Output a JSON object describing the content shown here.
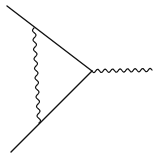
{
  "diagram": {
    "type": "feynman-vertex-correction",
    "canvas": {
      "width": 160,
      "height": 157,
      "background": "#ffffff",
      "stroke": "#111111"
    },
    "vertices": {
      "top": [
        34,
        28
      ],
      "bottom": [
        39,
        123
      ],
      "main": [
        92,
        71
      ]
    },
    "lines": [
      {
        "name": "incoming-fermion-top",
        "kind": "fermion",
        "from": [
          7,
          6
        ],
        "to": [
          92,
          71
        ]
      },
      {
        "name": "incoming-fermion-bottom",
        "kind": "fermion",
        "from": [
          11,
          152
        ],
        "to": [
          92,
          71
        ]
      },
      {
        "name": "external-photon",
        "kind": "boson",
        "from": [
          92,
          71
        ],
        "to": [
          152,
          70
        ],
        "waves": 8
      },
      {
        "name": "internal-photon",
        "kind": "boson",
        "from": [
          34,
          28
        ],
        "to": [
          39,
          123
        ],
        "waves": 10
      }
    ]
  }
}
